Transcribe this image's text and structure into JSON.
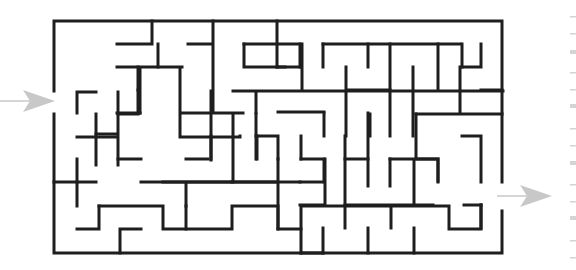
{
  "puzzle": {
    "type": "maze",
    "colors": {
      "wall": "#1e1e1e",
      "arrow": "#c8c8c8",
      "background": "#ffffff",
      "edge_marks": "#d4d4d4"
    },
    "grid": {
      "x": [
        54,
        77,
        99,
        121,
        144,
        166,
        189,
        211,
        233,
        256,
        278,
        301,
        323,
        345,
        368,
        390,
        413,
        435,
        457,
        480,
        502
      ],
      "y": [
        21,
        44,
        67,
        90,
        113,
        136,
        159,
        182,
        206,
        229,
        253
      ]
    },
    "entrance": {
      "label": "entrance-arrow",
      "side": "left",
      "row_y": 101,
      "from_x": 0,
      "to_x": 55
    },
    "exit": {
      "label": "exit-arrow",
      "side": "right",
      "row_y": 196,
      "from_x": 497,
      "to_x": 552
    },
    "walls": [
      [
        0,
        0,
        20,
        0
      ],
      [
        0,
        0,
        0,
        4
      ],
      [
        0,
        5,
        0,
        10
      ],
      [
        0,
        10,
        20,
        10
      ],
      [
        20,
        0,
        20,
        7
      ],
      [
        20,
        8,
        20,
        10
      ],
      [
        5,
        0,
        5,
        1
      ],
      [
        3,
        1,
        5,
        1
      ],
      [
        2,
        2,
        7,
        2
      ],
      [
        5,
        2,
        5,
        1.3
      ],
      [
        4,
        2,
        4,
        3
      ],
      [
        2,
        3,
        4,
        3
      ],
      [
        2,
        3,
        2,
        4
      ],
      [
        0,
        4,
        2,
        4
      ],
      [
        7,
        2,
        7,
        4
      ],
      [
        7,
        4,
        11,
        4
      ],
      [
        8,
        0,
        8,
        3
      ],
      [
        8,
        3,
        10,
        3
      ],
      [
        7,
        1,
        8,
        1
      ],
      [
        9,
        1,
        13,
        1
      ],
      [
        9,
        1,
        9,
        2
      ],
      [
        9,
        2,
        12,
        2
      ],
      [
        13,
        1,
        13,
        3
      ],
      [
        11,
        3,
        11,
        4
      ],
      [
        11,
        3,
        20,
        3
      ],
      [
        14,
        0,
        14,
        2
      ],
      [
        13,
        2,
        14,
        2
      ],
      [
        15,
        1,
        15,
        2
      ],
      [
        15,
        1,
        22,
        1
      ],
      [
        17,
        1,
        17,
        2
      ],
      [
        18,
        1,
        18,
        10
      ],
      [
        21,
        1,
        21,
        3
      ],
      [
        23,
        1,
        23,
        4
      ],
      [
        22,
        4,
        20,
        4
      ],
      [
        1,
        4,
        1,
        6
      ],
      [
        1,
        4,
        2,
        4
      ],
      [
        4,
        4,
        4,
        7
      ],
      [
        5,
        4,
        5,
        6
      ],
      [
        4,
        5,
        9,
        5
      ],
      [
        9,
        5,
        9,
        4
      ],
      [
        2,
        5,
        2,
        7
      ],
      [
        2,
        5,
        3,
        5
      ],
      [
        2,
        7,
        4,
        7
      ]
    ],
    "segments_px": [
      [
        54,
        21,
        502,
        21
      ],
      [
        54,
        21,
        54,
        91
      ],
      [
        54,
        114,
        54,
        253
      ],
      [
        54,
        253,
        502,
        253
      ],
      [
        502,
        21,
        502,
        182
      ],
      [
        502,
        211,
        502,
        253
      ],
      [
        152,
        21,
        152,
        44
      ],
      [
        116,
        44,
        152,
        44
      ],
      [
        116,
        67,
        182,
        67
      ],
      [
        158,
        44,
        158,
        67
      ],
      [
        188,
        44,
        214,
        44
      ],
      [
        214,
        21,
        214,
        112
      ],
      [
        214,
        112,
        244,
        112
      ],
      [
        138,
        67,
        138,
        136
      ],
      [
        138,
        136,
        283,
        136
      ],
      [
        283,
        112,
        283,
        160
      ],
      [
        96,
        67,
        96,
        90
      ],
      [
        96,
        90,
        116,
        90
      ],
      [
        116,
        67,
        116,
        90
      ],
      [
        77,
        90,
        96,
        90
      ],
      [
        77,
        90,
        77,
        114
      ],
      [
        54,
        114,
        77,
        114
      ],
      [
        245,
        44,
        321,
        44
      ],
      [
        245,
        44,
        245,
        67
      ],
      [
        245,
        67,
        291,
        67
      ],
      [
        321,
        44,
        321,
        113
      ],
      [
        278,
        113,
        388,
        113
      ],
      [
        278,
        113,
        278,
        136
      ],
      [
        276,
        21,
        276,
        67
      ],
      [
        276,
        67,
        307,
        67
      ],
      [
        258,
        39,
        258,
        58
      ],
      [
        300,
        44,
        300,
        67
      ],
      [
        323,
        44,
        460,
        44
      ],
      [
        323,
        44,
        323,
        67
      ],
      [
        346,
        44,
        346,
        67
      ],
      [
        368,
        44,
        368,
        253
      ],
      [
        346,
        67,
        346,
        253
      ],
      [
        346,
        90,
        346,
        116
      ],
      [
        403,
        44,
        403,
        90
      ],
      [
        393,
        67,
        393,
        113
      ],
      [
        437,
        67,
        437,
        159
      ],
      [
        437,
        67,
        458,
        67
      ],
      [
        458,
        44,
        458,
        67
      ],
      [
        480,
        90,
        502,
        90
      ],
      [
        437,
        113,
        502,
        113
      ],
      [
        310,
        90,
        368,
        90
      ],
      [
        346,
        113,
        346,
        159
      ]
    ]
  }
}
